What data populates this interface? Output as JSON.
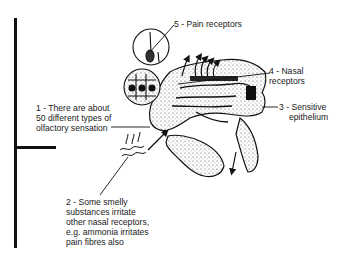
{
  "diagram": {
    "labels": [
      {
        "id": "1",
        "lines": [
          "1 - There are about",
          "50 different types of",
          "olfactory sensation"
        ]
      },
      {
        "id": "2",
        "lines": [
          "2 - Some smelly",
          "substances irritate",
          "other nasal receptors,",
          "e.g. ammonia irritates",
          "pain fibres also"
        ]
      },
      {
        "id": "3",
        "lines": [
          "3 - Sensitive",
          "epithelium"
        ]
      },
      {
        "id": "4",
        "lines": [
          "4 - Nasal",
          "receptors"
        ]
      },
      {
        "id": "5",
        "lines": [
          "5 - Pain receptors"
        ]
      }
    ],
    "colors": {
      "ink": "#111111",
      "background": "#ffffff",
      "stipple": "#555555"
    }
  }
}
